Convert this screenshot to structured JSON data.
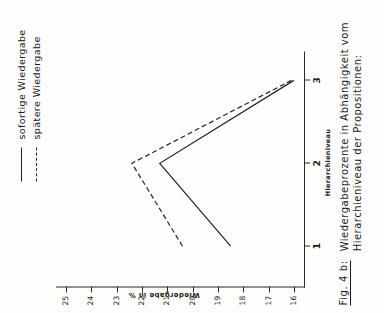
{
  "figure": {
    "caption_label": "Fig. 4 b:",
    "caption_line1": "Wiedergabeprozente in Abhängigkeit vom",
    "caption_line2": "Hierarchieniveau der Propositionen:"
  },
  "legend": {
    "items": [
      {
        "label": "sofortige Wiedergabe",
        "style": "solid"
      },
      {
        "label": "spätere Wiedergabe",
        "style": "dashed"
      }
    ]
  },
  "chart_data": {
    "type": "line",
    "title": "Wiedergabeprozente in Abhängigkeit vom Hierarchieniveau der Propositionen:",
    "xlabel": "Hierarchieniveau",
    "ylabel": "Wiedergabe in %",
    "x": [
      1,
      2,
      3
    ],
    "xticklabels": [
      "1",
      "2",
      "3"
    ],
    "xlim": [
      0.55,
      3.3
    ],
    "ylim": [
      15.6,
      25.4
    ],
    "yticks": [
      25,
      24,
      23,
      22,
      21,
      20,
      19,
      18,
      17,
      16
    ],
    "yticklabels": [
      "25",
      "24",
      "23",
      "22",
      "21",
      "20",
      "19",
      "18",
      "17",
      "16"
    ],
    "grid": false,
    "legend_position": "top-right",
    "series": [
      {
        "name": "sofortige Wiedergabe",
        "style": "solid",
        "values": [
          18.5,
          21.3,
          16.0
        ]
      },
      {
        "name": "spätere Wiedergabe",
        "style": "dashed",
        "values": [
          20.4,
          22.4,
          16.1
        ]
      }
    ]
  }
}
